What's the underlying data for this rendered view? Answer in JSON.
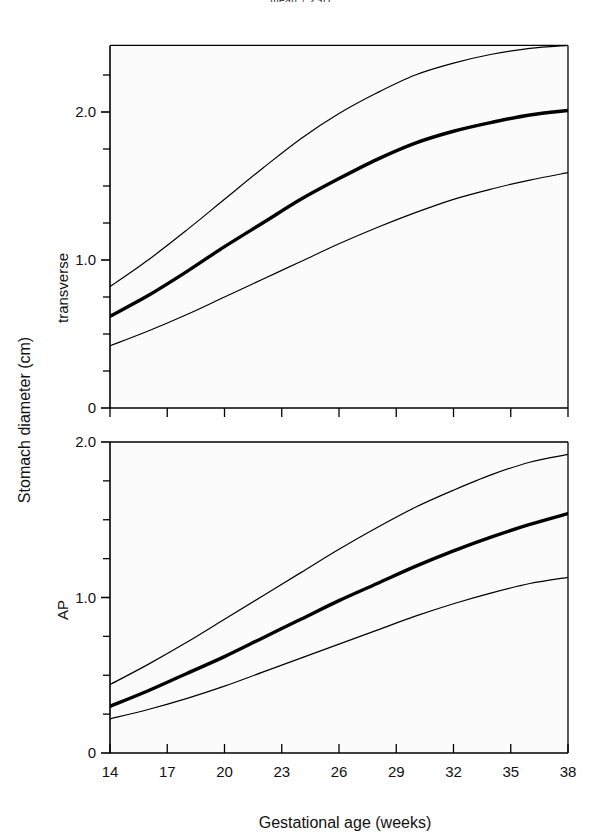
{
  "figure": {
    "top_caption": "mean ± 2SD",
    "y_axis_title": "Stomach diameter (cm)",
    "x_axis_title": "Gestational age (weeks)",
    "background": "#ffffff",
    "line_color": "#000000"
  },
  "chart_data": [
    {
      "type": "line",
      "title": "transverse",
      "panel_label": "transverse",
      "xlabel": "Gestational age (weeks)",
      "ylabel": "Stomach diameter (cm)",
      "xlim": [
        14,
        38
      ],
      "ylim": [
        0,
        2.45
      ],
      "xticks": [
        14,
        17,
        20,
        23,
        26,
        29,
        32,
        35,
        38
      ],
      "xtick_labels": [
        "14",
        "17",
        "20",
        "23",
        "26",
        "29",
        "32",
        "35",
        "38"
      ],
      "yticks": [
        0,
        1.0,
        2.0
      ],
      "ytick_labels": [
        "0",
        "1.0",
        "2.0"
      ],
      "y_minor_tick_step": 0.25,
      "grid": false,
      "legend": "none",
      "x": [
        14,
        16,
        18,
        20,
        22,
        24,
        26,
        28,
        30,
        32,
        34,
        36,
        38
      ],
      "series": [
        {
          "name": "+2SD",
          "style": "thin",
          "values": [
            0.82,
            1.0,
            1.2,
            1.41,
            1.62,
            1.82,
            1.99,
            2.13,
            2.25,
            2.33,
            2.39,
            2.43,
            2.45
          ]
        },
        {
          "name": "mean",
          "style": "thick",
          "values": [
            0.62,
            0.76,
            0.92,
            1.09,
            1.25,
            1.41,
            1.55,
            1.68,
            1.79,
            1.87,
            1.93,
            1.98,
            2.01
          ]
        },
        {
          "name": "-2SD",
          "style": "thin",
          "values": [
            0.42,
            0.52,
            0.63,
            0.75,
            0.87,
            0.99,
            1.11,
            1.22,
            1.32,
            1.41,
            1.48,
            1.54,
            1.59
          ]
        }
      ]
    },
    {
      "type": "line",
      "title": "AP",
      "panel_label": "AP",
      "xlabel": "Gestational age (weeks)",
      "ylabel": "Stomach diameter (cm)",
      "xlim": [
        14,
        38
      ],
      "ylim": [
        0,
        2.0
      ],
      "xticks": [
        14,
        17,
        20,
        23,
        26,
        29,
        32,
        35,
        38
      ],
      "xtick_labels": [
        "14",
        "17",
        "20",
        "23",
        "26",
        "29",
        "32",
        "35",
        "38"
      ],
      "yticks": [
        0,
        1.0,
        2.0
      ],
      "ytick_labels": [
        "0",
        "1.0",
        "2.0"
      ],
      "y_minor_tick_step": 0.25,
      "grid": false,
      "legend": "none",
      "x": [
        14,
        16,
        18,
        20,
        22,
        24,
        26,
        28,
        30,
        32,
        34,
        36,
        38
      ],
      "series": [
        {
          "name": "+2SD",
          "style": "thin",
          "values": [
            0.44,
            0.57,
            0.71,
            0.86,
            1.01,
            1.16,
            1.31,
            1.45,
            1.58,
            1.69,
            1.79,
            1.87,
            1.92
          ]
        },
        {
          "name": "mean",
          "style": "thick",
          "values": [
            0.3,
            0.4,
            0.51,
            0.62,
            0.74,
            0.86,
            0.98,
            1.09,
            1.2,
            1.3,
            1.39,
            1.47,
            1.54
          ]
        },
        {
          "name": "-2SD",
          "style": "thin",
          "values": [
            0.22,
            0.28,
            0.35,
            0.43,
            0.52,
            0.61,
            0.7,
            0.79,
            0.88,
            0.96,
            1.03,
            1.09,
            1.13
          ]
        }
      ]
    }
  ]
}
